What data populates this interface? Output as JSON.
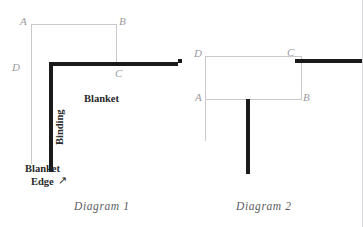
{
  "page": {
    "width": 363,
    "height": 227,
    "background": "#ffffff",
    "thick_line_color": "#1a1a1a",
    "thin_line_color": "#c9c9cc",
    "label_color": "#9a9a9f",
    "text_color": "#2a2a2a",
    "caption_color": "#5d5d62"
  },
  "diagram1": {
    "caption": "Diagram 1",
    "labels": {
      "a": "A",
      "b": "B",
      "c": "C",
      "d": "D"
    },
    "annotations": {
      "binding": "Binding",
      "blanket": "Blanket",
      "blanket_edge_line1": "Blanket",
      "blanket_edge_line2": "Edge",
      "arrow_glyph": "↗"
    }
  },
  "diagram2": {
    "caption": "Diagram 2",
    "labels": {
      "a": "A",
      "b": "B",
      "c": "C",
      "d": "D"
    }
  }
}
